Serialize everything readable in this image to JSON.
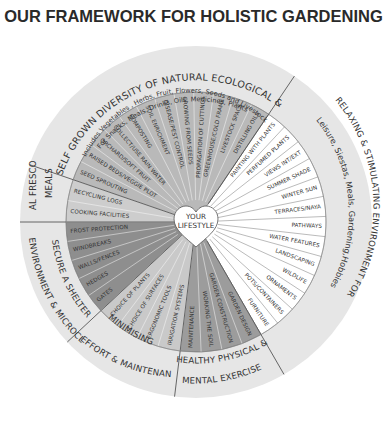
{
  "title": "OUR FRAMEWORK FOR HOLISTIC GARDENING",
  "center": {
    "line1": "YOUR",
    "line2": "LIFESTYLE",
    "shape": "heart-icon"
  },
  "colors": {
    "outer_ring": "#e6e6e6",
    "crops_fill": "#b9b9b9",
    "alfresco_fill": "#cdcdcd",
    "secure_fill": "#8e8e8e",
    "minimising_fill": "#c9c9c9",
    "healthy_fill": "#9c9c9c",
    "relaxing_fill": "#ffffff",
    "line": "#555555"
  },
  "sectors": [
    {
      "id": "crops",
      "ring_label": "SELF GROWN DIVERSITY OF NATURAL ECOLOGICAL & ORGANIC CROPS",
      "ring_sub1": "For Snacks, Meals, Drinks, Oils, Medicines, Plants",
      "ring_sub2": "Includes Vegetables , Herbs, Fruit, Flowers, Seeds and Livestock",
      "spokes": [
        "SEED SPROUTING",
        "RAISED BEDS/VEGGIE PLOT",
        "ORCHARD/SOFT FRUIT",
        "COLLECT/USE RAIN WATER",
        "COMPOSTING",
        "SOIL ENRICHMENT",
        "DISEASE/PEST CONTROL",
        "GROWING FROM SEEDS",
        "PROPAGATION OF CUTTINGS",
        "GREENHOUSE/COLD FRAME",
        "LIVESTOCK SPACE",
        "DISTILLING OILS"
      ]
    },
    {
      "id": "relaxing",
      "ring_label": "RELAXING & STIMULATING ENVIRONMENT FOR",
      "ring_sub1": "Leisure, Siestas, Meals, Gardening,Hobbies",
      "spokes": [
        "PAINTING WITH PLANTS",
        "PERFUMED PLANTS",
        "VIEWS INT/EXT",
        "SUMMER SHADE",
        "WINTER SUN",
        "TERRACES/NAYA",
        "PATHWAYS",
        "WATER FEATURES",
        "LANDSCAPING",
        "WILDLIFE",
        "ORNAMENTS",
        "POTS/CONTAINERS",
        "FURNITURE"
      ]
    },
    {
      "id": "healthy",
      "ring_label1": "HEALTHY PHYSICAL &",
      "ring_label2": "MENTAL EXERCISE",
      "spokes": [
        "GARDEN DESIGN",
        "GARDEN CONSTRUCTION",
        "WORKING THE SOIL",
        "MAINTENANCE"
      ]
    },
    {
      "id": "minimising",
      "ring_label1": "MINIMISING",
      "ring_label2": "EFFORT & MAINTENANCE",
      "spokes": [
        "IRRIGATION SYSTEMS",
        "ERGONOMIC TOOLS",
        "CHOICE OF SURFACES",
        "CHOICE OF PLANTS"
      ]
    },
    {
      "id": "secure",
      "ring_label1": "SECURE A SHELTERED",
      "ring_label2": "ENVIRONMENT & MICROCLIMATE",
      "spokes": [
        "GATES",
        "HEDGES",
        "WALLS/FENCES",
        "WINDBREAKS",
        "FROST PROTECTION"
      ]
    },
    {
      "id": "alfresco",
      "ring_label1": "AL FRESCO",
      "ring_label2": "MEALS",
      "spokes": [
        "RECYCLING LOGS",
        "COOKING FACILITIES"
      ]
    }
  ]
}
